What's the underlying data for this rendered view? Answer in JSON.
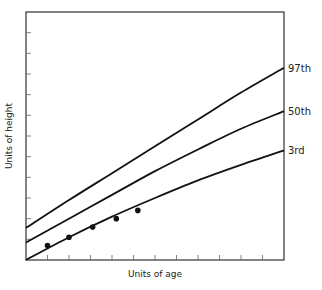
{
  "chart_data": {
    "type": "line",
    "title": "",
    "xlabel": "Units of age",
    "ylabel": "Units of height",
    "xlim": [
      0,
      12
    ],
    "ylim": [
      0,
      12
    ],
    "grid": false,
    "x_ticks": [
      1,
      2,
      3,
      4,
      5,
      6,
      7,
      8,
      9,
      10,
      11
    ],
    "y_ticks": [
      1,
      2,
      3,
      4,
      5,
      6,
      7,
      8,
      9,
      10,
      11
    ],
    "legend_position": "right-end labels",
    "series": [
      {
        "name": "97th",
        "x": [
          0,
          2,
          4,
          6,
          8,
          10,
          12
        ],
        "y": [
          1.55,
          2.9,
          4.2,
          5.5,
          6.8,
          8.1,
          9.3
        ]
      },
      {
        "name": "50th",
        "x": [
          0,
          2,
          4,
          6,
          8,
          10,
          12
        ],
        "y": [
          0.85,
          2.0,
          3.15,
          4.3,
          5.35,
          6.35,
          7.2
        ]
      },
      {
        "name": "3rd",
        "x": [
          0,
          2,
          4,
          6,
          8,
          10,
          12
        ],
        "y": [
          0,
          1.1,
          2.1,
          3.0,
          3.85,
          4.6,
          5.3
        ]
      }
    ],
    "points": {
      "name": "measurements",
      "x": [
        1,
        2,
        3.1,
        4.2,
        5.2
      ],
      "y": [
        0.7,
        1.1,
        1.6,
        2.0,
        2.4
      ]
    }
  }
}
